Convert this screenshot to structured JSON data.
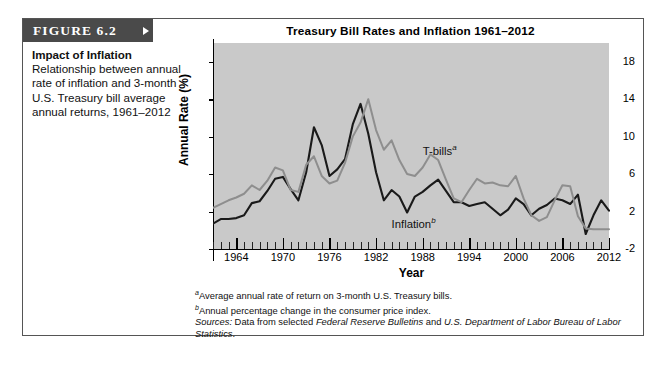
{
  "figure": {
    "badge": "FIGURE 6.2",
    "caption_title": "Impact of Inflation",
    "caption_body": "Relationship between annual rate of inflation and 3-month U.S. Treasury bill average annual returns, 1961–2012"
  },
  "footnotes": {
    "a_marker": "a",
    "a_text": "Average annual rate of return on 3-month U.S. Treasury bills.",
    "b_marker": "b",
    "b_text": "Annual percentage change in the consumer price index.",
    "sources_label": "Sources:",
    "sources_pre": " Data from selected ",
    "sources_italic1": "Federal Reserve Bulletins",
    "sources_mid": " and ",
    "sources_italic2": "U.S. Department of Labor Bureau of Labor Statistics",
    "sources_end": "."
  },
  "chart_data": {
    "type": "line",
    "title": "Treasury Bill Rates and Inflation 1961–2012",
    "xlabel": "Year",
    "ylabel": "Annual Rate (%)",
    "xlim": [
      1961,
      2012
    ],
    "ylim": [
      -2,
      20
    ],
    "yticks": [
      -2,
      2,
      6,
      10,
      14,
      18
    ],
    "xticks": [
      1964,
      1970,
      1976,
      1982,
      1988,
      1994,
      2000,
      2006,
      2012
    ],
    "grid": false,
    "plot_background": "#c9c9c9",
    "legend": "inline-labels",
    "annotations": [
      {
        "text": "T-bills",
        "sup": "a",
        "x": 1988,
        "y": 8.6
      },
      {
        "text": "Inflation",
        "sup": "b",
        "x": 1984,
        "y": 0.8
      }
    ],
    "x": [
      1961,
      1962,
      1963,
      1964,
      1965,
      1966,
      1967,
      1968,
      1969,
      1970,
      1971,
      1972,
      1973,
      1974,
      1975,
      1976,
      1977,
      1978,
      1979,
      1980,
      1981,
      1982,
      1983,
      1984,
      1985,
      1986,
      1987,
      1988,
      1989,
      1990,
      1991,
      1992,
      1993,
      1994,
      1995,
      1996,
      1997,
      1998,
      1999,
      2000,
      2001,
      2002,
      2003,
      2004,
      2005,
      2006,
      2007,
      2008,
      2009,
      2010,
      2011,
      2012
    ],
    "series": [
      {
        "name": "T-bills",
        "color": "#8e8e8e",
        "values": [
          2.4,
          2.8,
          3.2,
          3.5,
          3.9,
          4.8,
          4.3,
          5.3,
          6.7,
          6.4,
          4.3,
          4.1,
          7.0,
          7.9,
          5.8,
          5.0,
          5.3,
          7.2,
          10.0,
          11.5,
          14.0,
          10.7,
          8.6,
          9.6,
          7.5,
          6.0,
          5.8,
          6.7,
          8.1,
          7.5,
          5.4,
          3.4,
          3.0,
          4.3,
          5.5,
          5.0,
          5.1,
          4.8,
          4.7,
          5.8,
          3.4,
          1.6,
          1.0,
          1.4,
          3.2,
          4.8,
          4.7,
          1.5,
          0.2,
          0.1,
          0.1,
          0.1
        ]
      },
      {
        "name": "Inflation",
        "color": "#1a1a1a",
        "values": [
          0.7,
          1.2,
          1.2,
          1.3,
          1.6,
          2.9,
          3.1,
          4.2,
          5.5,
          5.7,
          4.4,
          3.2,
          6.2,
          11.0,
          9.1,
          5.8,
          6.5,
          7.6,
          11.3,
          13.5,
          10.3,
          6.2,
          3.2,
          4.3,
          3.6,
          1.9,
          3.6,
          4.1,
          4.8,
          5.4,
          4.2,
          3.0,
          3.0,
          2.6,
          2.8,
          3.0,
          2.3,
          1.6,
          2.2,
          3.4,
          2.8,
          1.6,
          2.3,
          2.7,
          3.4,
          3.2,
          2.8,
          3.8,
          -0.4,
          1.6,
          3.2,
          2.1
        ]
      }
    ]
  }
}
